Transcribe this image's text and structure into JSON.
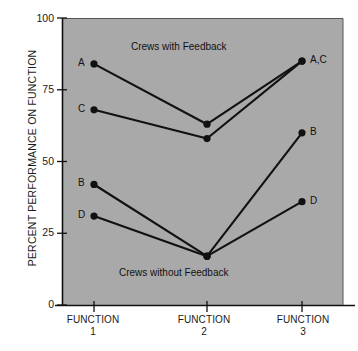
{
  "chart_data": {
    "type": "line",
    "title": "",
    "xlabel": "",
    "ylabel": "PERCENT PERFORMANCE ON FUNCTION",
    "categories": [
      "FUNCTION 1",
      "FUNCTION 2",
      "FUNCTION 3"
    ],
    "x_tick_lines": [
      {
        "word": "FUNCTION",
        "num": "1"
      },
      {
        "word": "FUNCTION",
        "num": "2"
      },
      {
        "word": "FUNCTION",
        "num": "3"
      }
    ],
    "ylim": [
      0,
      100
    ],
    "yticks": [
      0,
      25,
      50,
      75,
      100
    ],
    "ytick_labels": [
      "0",
      "25",
      "50",
      "75",
      "100"
    ],
    "grid": false,
    "legend_position": "inline-annotations",
    "plot_background_color": "#a9a9a9",
    "line_color": "#111111",
    "marker_color": "#111111",
    "series": [
      {
        "name": "A",
        "values": [
          84,
          63,
          85
        ],
        "group": "Crews with Feedback"
      },
      {
        "name": "C",
        "values": [
          68,
          58,
          85
        ],
        "group": "Crews with Feedback"
      },
      {
        "name": "B",
        "values": [
          42,
          17,
          60
        ],
        "group": "Crews without Feedback"
      },
      {
        "name": "D",
        "values": [
          31,
          17,
          36
        ],
        "group": "Crews without Feedback"
      }
    ],
    "annotations": [
      {
        "text": "Crews with Feedback",
        "x": 2,
        "y": 90
      },
      {
        "text": "Crews without Feedback",
        "x": 2,
        "y": 11
      }
    ],
    "point_labels": {
      "left": [
        {
          "text": "A",
          "series": "A"
        },
        {
          "text": "C",
          "series": "C"
        },
        {
          "text": "B",
          "series": "B"
        },
        {
          "text": "D",
          "series": "D"
        }
      ],
      "right": [
        {
          "text": "A,C",
          "series": "A"
        },
        {
          "text": "B",
          "series": "B"
        },
        {
          "text": "D",
          "series": "D"
        }
      ]
    }
  }
}
